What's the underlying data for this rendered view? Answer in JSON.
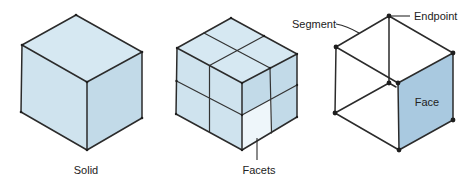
{
  "figures": [
    {
      "id": "solid",
      "label": "Solid",
      "description": "Shaded cube representing a solid"
    },
    {
      "id": "facets",
      "label": "Facets",
      "description": "Cube subdivided into a 2x2 grid on each visible face, with one facet highlighted"
    },
    {
      "id": "wireframe",
      "labels": {
        "segment": "Segment",
        "endpoint": "Endpoint",
        "face": "Face"
      },
      "description": "Wireframe cube showing segments, endpoints and one shaded face"
    }
  ],
  "colors": {
    "solid_top": "#d6e8f2",
    "solid_left": "#cfe3ee",
    "solid_right": "#c2dae8",
    "facet_highlight": "#eef6fa",
    "face_fill": "#a9c9e0",
    "stroke": "#2b2b2b"
  }
}
